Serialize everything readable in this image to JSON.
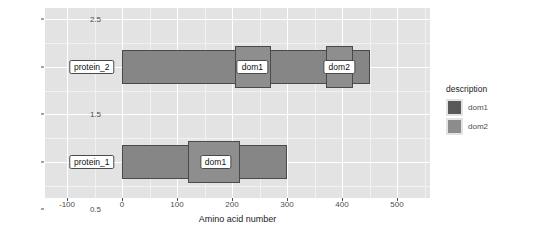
{
  "chart_data": {
    "type": "bar",
    "title": "",
    "xlabel": "Amino acid number",
    "ylabel": "",
    "xlim": [
      -140,
      560
    ],
    "ylim": [
      0.62,
      2.62
    ],
    "xticks": [
      "-100",
      "0",
      "100",
      "200",
      "300",
      "400",
      "500"
    ],
    "xtick_values": [
      -100,
      0,
      100,
      200,
      300,
      400,
      500
    ],
    "yticks": [
      "0.5",
      "1.0",
      "1.5",
      "2.0",
      "2.5"
    ],
    "ytick_values": [
      0.5,
      1.0,
      1.5,
      2.0,
      2.5
    ],
    "grid": true,
    "legend_position": "right",
    "proteins": [
      {
        "name": "protein_2",
        "y": 2.0,
        "start": 0,
        "end": 450,
        "label_x": -55,
        "domains": [
          {
            "name": "dom1",
            "start": 205,
            "end": 270,
            "label_x": 237
          },
          {
            "name": "dom2",
            "start": 370,
            "end": 420,
            "label_x": 395
          }
        ]
      },
      {
        "name": "protein_1",
        "y": 1.0,
        "start": 0,
        "end": 300,
        "label_x": -55,
        "domains": [
          {
            "name": "dom1",
            "start": 120,
            "end": 215,
            "label_x": 170
          }
        ]
      }
    ],
    "legend": {
      "title": "description",
      "entries": [
        {
          "label": "dom1",
          "color": "#595959"
        },
        {
          "label": "dom2",
          "color": "#8c8c8c"
        }
      ]
    },
    "colors": {
      "panel_background": "#e3e3e3",
      "grid_major": "#ffffff",
      "grid_minor": "#f2f2f2",
      "bar_fill": "#868686",
      "bar_outline": "#4a4a4a",
      "domain_fill": "#8e8e8e",
      "text": "#4d4d4d"
    }
  }
}
